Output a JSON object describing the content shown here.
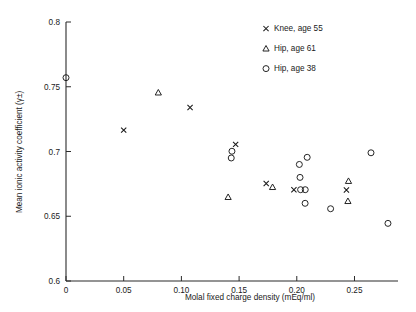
{
  "chart_data": {
    "type": "scatter",
    "title": "",
    "xlabel": "Molal fixed charge density (mEq/ml)",
    "ylabel": "Mean ionic activity coefficient (γ±)",
    "xlim": [
      0,
      0.2877
    ],
    "ylim": [
      0.6,
      0.8
    ],
    "xticks": [
      0,
      0.05,
      0.1,
      0.15,
      0.2,
      0.25
    ],
    "xticklabels": [
      "0",
      "0.05",
      "0.10",
      "0.15",
      "0.20",
      "0.25"
    ],
    "yticks": [
      0.6,
      0.65,
      0.7,
      0.75,
      0.8
    ],
    "yticklabels": [
      "0.6",
      "0.65",
      "0.7",
      "0.75",
      "0.8"
    ],
    "grid": false,
    "legend_position": "top-right",
    "series": [
      {
        "name": "Knee, age 55",
        "marker": "x",
        "points": [
          {
            "x": 0.05,
            "y": 0.7165
          },
          {
            "x": 0.1075,
            "y": 0.734
          },
          {
            "x": 0.147,
            "y": 0.7055
          },
          {
            "x": 0.1735,
            "y": 0.6753
          },
          {
            "x": 0.1975,
            "y": 0.6705
          },
          {
            "x": 0.243,
            "y": 0.6703
          }
        ]
      },
      {
        "name": "Hip, age 61",
        "marker": "triangle",
        "points": [
          {
            "x": 0.08,
            "y": 0.7455
          },
          {
            "x": 0.1405,
            "y": 0.6648
          },
          {
            "x": 0.179,
            "y": 0.6725
          },
          {
            "x": 0.2448,
            "y": 0.6772
          },
          {
            "x": 0.2443,
            "y": 0.6617
          }
        ]
      },
      {
        "name": "Hip, age 38",
        "marker": "circle",
        "points": [
          {
            "x": 0.0,
            "y": 0.757
          },
          {
            "x": 0.1438,
            "y": 0.7002
          },
          {
            "x": 0.1432,
            "y": 0.695
          },
          {
            "x": 0.2022,
            "y": 0.69
          },
          {
            "x": 0.209,
            "y": 0.6955
          },
          {
            "x": 0.2028,
            "y": 0.68
          },
          {
            "x": 0.2033,
            "y": 0.6705
          },
          {
            "x": 0.2073,
            "y": 0.6705
          },
          {
            "x": 0.2072,
            "y": 0.66
          },
          {
            "x": 0.2293,
            "y": 0.6558
          },
          {
            "x": 0.2643,
            "y": 0.699
          },
          {
            "x": 0.279,
            "y": 0.6445
          }
        ]
      }
    ]
  },
  "legend": {
    "items": [
      {
        "label": "Knee, age 55",
        "marker": "x"
      },
      {
        "label": "Hip, age 61",
        "marker": "triangle"
      },
      {
        "label": "Hip, age 38",
        "marker": "circle"
      }
    ]
  },
  "axes": {
    "x_title": "Molal fixed charge density (mEq/ml)",
    "y_title": "Mean ionic activity coefficient (γ±)"
  }
}
